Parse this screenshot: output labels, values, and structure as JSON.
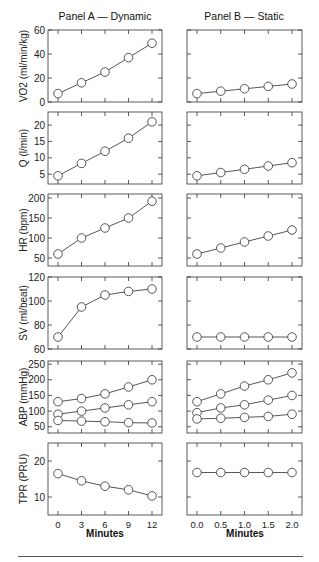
{
  "titles": {
    "panel_a": "Panel A — Dynamic",
    "panel_b": "Panel B — Static"
  },
  "xlabel_a": "Minutes",
  "xlabel_b": "Minutes",
  "colors": {
    "axis": "#333333",
    "line": "#444444",
    "marker_fill": "#ffffff",
    "text": "#222222"
  },
  "chart_data": [
    {
      "type": "line",
      "panel": "A",
      "row": 0,
      "title": "Panel A — Dynamic",
      "ylabel": "VO2 (ml/min/kg)",
      "xlabel": "Minutes",
      "x": [
        0,
        3,
        6,
        9,
        12
      ],
      "ylim": [
        0,
        60
      ],
      "yticks": [
        0,
        20,
        40,
        60
      ],
      "series": [
        {
          "name": "VO2",
          "values": [
            7,
            16,
            25,
            37,
            49
          ]
        }
      ]
    },
    {
      "type": "line",
      "panel": "B",
      "row": 0,
      "title": "Panel B — Static",
      "ylabel": "VO2 (ml/min/kg)",
      "xlabel": "Minutes",
      "x": [
        0.0,
        0.5,
        1.0,
        1.5,
        2.0
      ],
      "ylim": [
        0,
        60
      ],
      "yticks": [
        0,
        20,
        40,
        60
      ],
      "series": [
        {
          "name": "VO2",
          "values": [
            7,
            9,
            11,
            13,
            15
          ]
        }
      ]
    },
    {
      "type": "line",
      "panel": "A",
      "row": 1,
      "ylabel": "Q (l/min)",
      "x": [
        0,
        3,
        6,
        9,
        12
      ],
      "ylim": [
        2,
        24
      ],
      "yticks": [
        5,
        10,
        15,
        20
      ],
      "series": [
        {
          "name": "Q",
          "values": [
            4.5,
            8.3,
            12,
            16,
            21
          ]
        }
      ]
    },
    {
      "type": "line",
      "panel": "B",
      "row": 1,
      "ylabel": "Q (l/min)",
      "x": [
        0.0,
        0.5,
        1.0,
        1.5,
        2.0
      ],
      "ylim": [
        2,
        24
      ],
      "yticks": [
        5,
        10,
        15,
        20
      ],
      "series": [
        {
          "name": "Q",
          "values": [
            4.5,
            5.5,
            6.5,
            7.5,
            8.5
          ]
        }
      ]
    },
    {
      "type": "line",
      "panel": "A",
      "row": 2,
      "ylabel": "HR (bpm)",
      "x": [
        0,
        3,
        6,
        9,
        12
      ],
      "ylim": [
        30,
        210
      ],
      "yticks": [
        50,
        100,
        150,
        200
      ],
      "series": [
        {
          "name": "HR",
          "values": [
            60,
            100,
            125,
            150,
            192
          ]
        }
      ]
    },
    {
      "type": "line",
      "panel": "B",
      "row": 2,
      "ylabel": "HR (bpm)",
      "x": [
        0.0,
        0.5,
        1.0,
        1.5,
        2.0
      ],
      "ylim": [
        30,
        210
      ],
      "yticks": [
        50,
        100,
        150,
        200
      ],
      "series": [
        {
          "name": "HR",
          "values": [
            60,
            75,
            90,
            105,
            120
          ]
        }
      ]
    },
    {
      "type": "line",
      "panel": "A",
      "row": 3,
      "ylabel": "SV (ml/beat)",
      "x": [
        0,
        3,
        6,
        9,
        12
      ],
      "ylim": [
        60,
        120
      ],
      "yticks": [
        60,
        80,
        100,
        120
      ],
      "series": [
        {
          "name": "SV",
          "values": [
            70,
            95,
            105,
            108,
            110
          ]
        }
      ]
    },
    {
      "type": "line",
      "panel": "B",
      "row": 3,
      "ylabel": "SV (ml/beat)",
      "x": [
        0.0,
        0.5,
        1.0,
        1.5,
        2.0
      ],
      "ylim": [
        60,
        120
      ],
      "yticks": [
        60,
        80,
        100,
        120
      ],
      "series": [
        {
          "name": "SV",
          "values": [
            70,
            70,
            70,
            70,
            70
          ]
        }
      ]
    },
    {
      "type": "line",
      "panel": "A",
      "row": 4,
      "ylabel": "ABP (mmHg)",
      "x": [
        0,
        3,
        6,
        9,
        12
      ],
      "ylim": [
        30,
        260
      ],
      "yticks": [
        50,
        100,
        150,
        200,
        250
      ],
      "series": [
        {
          "name": "Systolic",
          "values": [
            130,
            140,
            155,
            177,
            200
          ]
        },
        {
          "name": "Mean",
          "values": [
            90,
            100,
            110,
            120,
            130
          ]
        },
        {
          "name": "Diastolic",
          "values": [
            70,
            68,
            66,
            63,
            62
          ]
        }
      ]
    },
    {
      "type": "line",
      "panel": "B",
      "row": 4,
      "ylabel": "ABP (mmHg)",
      "x": [
        0.0,
        0.5,
        1.0,
        1.5,
        2.0
      ],
      "ylim": [
        30,
        260
      ],
      "yticks": [
        50,
        100,
        150,
        200,
        250
      ],
      "series": [
        {
          "name": "Systolic",
          "values": [
            130,
            155,
            180,
            200,
            222
          ]
        },
        {
          "name": "Mean",
          "values": [
            95,
            110,
            120,
            135,
            150
          ]
        },
        {
          "name": "Diastolic",
          "values": [
            75,
            77,
            80,
            83,
            90
          ]
        }
      ]
    },
    {
      "type": "line",
      "panel": "A",
      "row": 5,
      "ylabel": "TPR (PRU)",
      "xlabel": "Minutes",
      "x": [
        0,
        3,
        6,
        9,
        12
      ],
      "ylim": [
        5,
        25
      ],
      "yticks": [
        10,
        20
      ],
      "xticklabels": [
        "0",
        "3",
        "6",
        "9",
        "12"
      ],
      "series": [
        {
          "name": "TPR",
          "values": [
            16.5,
            14.5,
            13,
            12,
            10.3
          ]
        }
      ]
    },
    {
      "type": "line",
      "panel": "B",
      "row": 5,
      "ylabel": "TPR (PRU)",
      "xlabel": "Minutes",
      "x": [
        0.0,
        0.5,
        1.0,
        1.5,
        2.0
      ],
      "ylim": [
        5,
        25
      ],
      "yticks": [
        10,
        20
      ],
      "xticklabels": [
        "0.0",
        "0.5",
        "1.0",
        "1.5",
        "2.0"
      ],
      "series": [
        {
          "name": "TPR",
          "values": [
            16.8,
            16.8,
            16.8,
            16.8,
            16.8
          ]
        }
      ]
    }
  ]
}
